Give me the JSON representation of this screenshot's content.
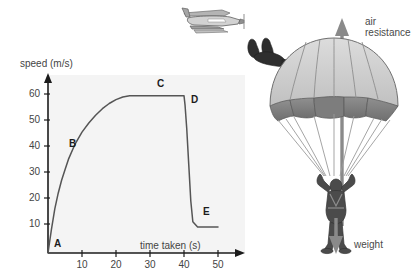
{
  "chart_data": {
    "type": "line",
    "title": "",
    "xlabel": "time taken (s)",
    "ylabel": "speed (m/s)",
    "xlim": [
      0,
      52
    ],
    "ylim": [
      0,
      68
    ],
    "xticks": [
      10,
      20,
      30,
      40,
      50
    ],
    "yticks": [
      10,
      20,
      30,
      40,
      50,
      60
    ],
    "grid": false,
    "legend": "none",
    "background": "#f4f4f4",
    "line_color": "#555555",
    "series": [
      {
        "name": "speed of skydiver",
        "x": [
          0,
          1,
          2,
          3,
          4,
          5,
          6,
          8,
          10,
          12,
          14,
          16,
          18,
          20,
          22,
          24,
          26,
          30,
          34,
          38,
          40,
          40.3,
          40.8,
          41.4,
          42,
          42.6,
          44,
          47,
          50
        ],
        "y": [
          0,
          9,
          17,
          23,
          28,
          32,
          36,
          42,
          46.5,
          50,
          53,
          55.5,
          57.5,
          59,
          60,
          60.5,
          60.5,
          60.5,
          60.5,
          60.5,
          60.5,
          57,
          48,
          34,
          20,
          12,
          10,
          10,
          10
        ]
      }
    ],
    "annotations": [
      {
        "label": "A",
        "x": 1.5,
        "y": 2,
        "note": "jumps from plane, speed zero"
      },
      {
        "label": "B",
        "x": 8,
        "y": 45,
        "note": "accelerating, air resistance increasing"
      },
      {
        "label": "C",
        "x": 32,
        "y": 64,
        "note": "terminal velocity reached"
      },
      {
        "label": "D",
        "x": 41.5,
        "y": 59,
        "note": "parachute opens"
      },
      {
        "label": "E",
        "x": 46,
        "y": 16,
        "note": "new lower terminal velocity"
      }
    ]
  },
  "chart": {
    "y_axis_title": "speed (m/s)",
    "x_axis_title": "time taken (s)",
    "y_tick_labels": [
      "60",
      "50",
      "40",
      "30",
      "20",
      "10"
    ],
    "x_tick_labels": [
      "10",
      "20",
      "30",
      "40",
      "50"
    ],
    "point_labels": [
      "A",
      "B",
      "C",
      "D",
      "E"
    ]
  },
  "illustration": {
    "plane_name": "airplane",
    "freefaller_name": "skydiver-freefall",
    "parachutist_name": "parachutist",
    "force_up_label": "air\nresistance",
    "force_up_line1": "air",
    "force_up_line2": "resistance",
    "force_down_label": "weight",
    "colors": {
      "canopy_light": "#c9c9c9",
      "canopy_mid": "#a8a8a8",
      "canopy_dark": "#7d7d7d",
      "body_dark": "#4b4b4b",
      "arrow": "#8a8a8a",
      "plane_grey": "#9a9a9a"
    }
  }
}
